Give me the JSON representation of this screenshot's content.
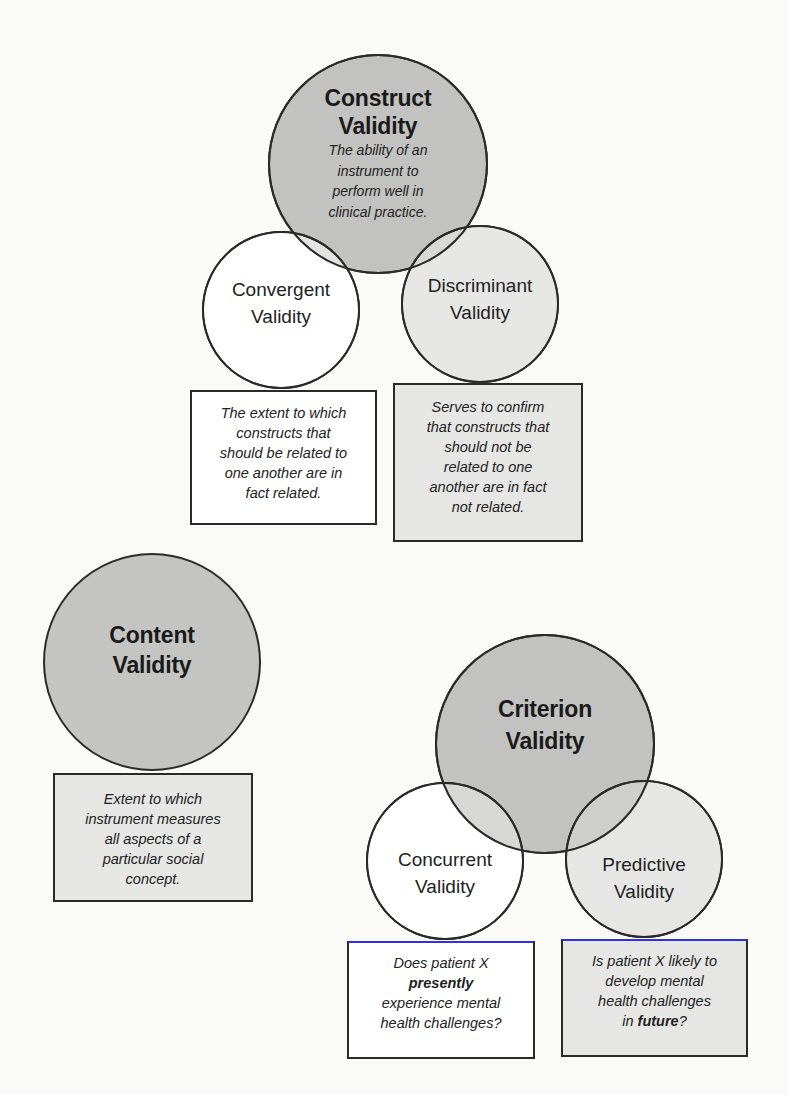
{
  "diagram": {
    "colors": {
      "background": "#fafaf8",
      "dark_fill": "#c2c2c0",
      "light_fill": "#e6e6e4",
      "white_fill": "#ffffff",
      "stroke": "#2a2a2a",
      "highlight_border": "#3030e0"
    },
    "construct": {
      "title_line1": "Construct",
      "title_line2": "Validity",
      "description_lines": [
        "The ability of an",
        "instrument to",
        "perform well in",
        "clinical practice."
      ],
      "convergent": {
        "title_line1": "Convergent",
        "title_line2": "Validity",
        "description_lines": [
          "The extent to which",
          "constructs that",
          "should be related to",
          "one another are in",
          "fact related."
        ]
      },
      "discriminant": {
        "title_line1": "Discriminant",
        "title_line2": "Validity",
        "description_lines": [
          "Serves to confirm",
          "that constructs that",
          "should not be",
          "related to one",
          "another are in fact",
          "not related."
        ]
      }
    },
    "content": {
      "title_line1": "Content",
      "title_line2": "Validity",
      "description_lines": [
        "Extent to which",
        "instrument measures",
        "all aspects of a",
        "particular social",
        "concept."
      ]
    },
    "criterion": {
      "title_line1": "Criterion",
      "title_line2": "Validity",
      "concurrent": {
        "title_line1": "Concurrent",
        "title_line2": "Validity",
        "description_line1": "Does patient X",
        "description_emphasis": "presently",
        "description_line3": "experience mental",
        "description_line4": "health challenges?"
      },
      "predictive": {
        "title_line1": "Predictive",
        "title_line2": "Validity",
        "description_line1": "Is patient X likely to",
        "description_line2": "develop mental",
        "description_line3": "health challenges",
        "description_line4_prefix": "in ",
        "description_emphasis": "future",
        "description_line4_suffix": "?"
      }
    }
  }
}
